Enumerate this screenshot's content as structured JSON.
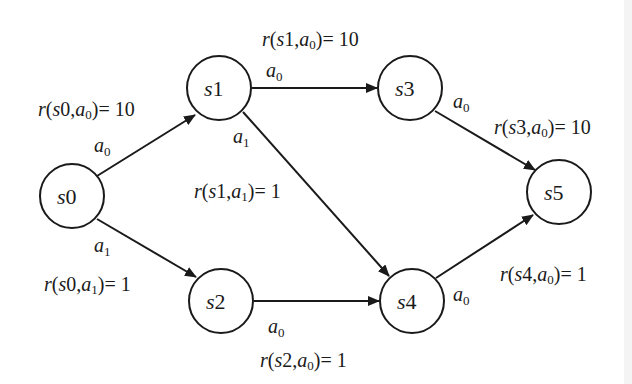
{
  "diagram": {
    "colors": {
      "stroke": "#1a1a1a",
      "node_fill": "#ffffff",
      "background": "#ffffff"
    },
    "nodes": [
      {
        "id": "s0",
        "label": "s",
        "sub": "0",
        "cx": 72,
        "cy": 196
      },
      {
        "id": "s1",
        "label": "s",
        "sub": "1",
        "cx": 219,
        "cy": 88
      },
      {
        "id": "s2",
        "label": "s",
        "sub": "2",
        "cx": 221,
        "cy": 301
      },
      {
        "id": "s3",
        "label": "s",
        "sub": "3",
        "cx": 410,
        "cy": 88
      },
      {
        "id": "s4",
        "label": "s",
        "sub": "4",
        "cx": 412,
        "cy": 301
      },
      {
        "id": "s5",
        "label": "s",
        "sub": "5",
        "cx": 559,
        "cy": 192
      }
    ],
    "edges": [
      {
        "from": "s0",
        "to": "s1",
        "action": "a",
        "action_sub": "0",
        "reward_text": "r(s0,a0)= 10",
        "reward": 10
      },
      {
        "from": "s0",
        "to": "s2",
        "action": "a",
        "action_sub": "1",
        "reward_text": "r(s0,a1)= 1",
        "reward": 1
      },
      {
        "from": "s1",
        "to": "s3",
        "action": "a",
        "action_sub": "0",
        "reward_text": "r(s1,a0)= 10",
        "reward": 10
      },
      {
        "from": "s1",
        "to": "s4",
        "action": "a",
        "action_sub": "1",
        "reward_text": "r(s1,a1)= 1",
        "reward": 1
      },
      {
        "from": "s2",
        "to": "s4",
        "action": "a",
        "action_sub": "0",
        "reward_text": "r(s2,a0)= 1",
        "reward": 1
      },
      {
        "from": "s3",
        "to": "s5",
        "action": "a",
        "action_sub": "0",
        "reward_text": "r(s3,a0)= 10",
        "reward": 10
      },
      {
        "from": "s4",
        "to": "s5",
        "action": "a",
        "action_sub": "0",
        "reward_text": "r(s4,a0)= 1",
        "reward": 1
      }
    ],
    "reward_labels": {
      "s0a0": {
        "s": "0",
        "a": "0",
        "value": "10"
      },
      "s0a1": {
        "s": "0",
        "a": "1",
        "value": "1"
      },
      "s1a0": {
        "s": "1",
        "a": "0",
        "value": "10"
      },
      "s1a1": {
        "s": "1",
        "a": "1",
        "value": "1"
      },
      "s2a0": {
        "s": "2",
        "a": "0",
        "value": "1"
      },
      "s3a0": {
        "s": "3",
        "a": "0",
        "value": "10"
      },
      "s4a0": {
        "s": "4",
        "a": "0",
        "value": "1"
      }
    },
    "text": {
      "r": "r(",
      "s": "s",
      "a": "a",
      "comma": ",",
      "close_eq": ")= "
    }
  }
}
